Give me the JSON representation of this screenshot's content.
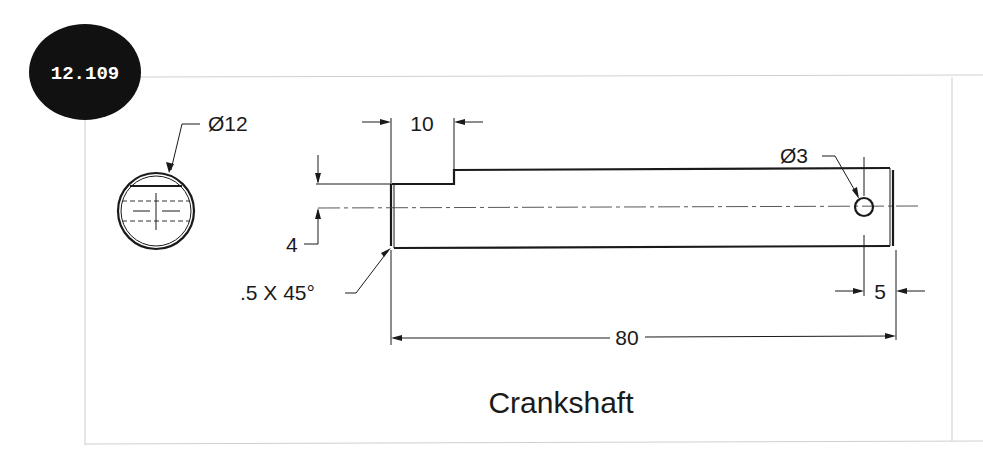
{
  "badge": {
    "label": "12.109",
    "color": "#111111"
  },
  "drawing": {
    "title": "Crankshaft",
    "end_view": {
      "diameter_label": "Ø12"
    },
    "side_view": {
      "step_length_label": "10",
      "flat_depth_label": "4",
      "chamfer_label": ".5 X 45°",
      "hole_diameter_label": "Ø3",
      "hole_offset_label": "5",
      "overall_length_label": "80"
    }
  }
}
